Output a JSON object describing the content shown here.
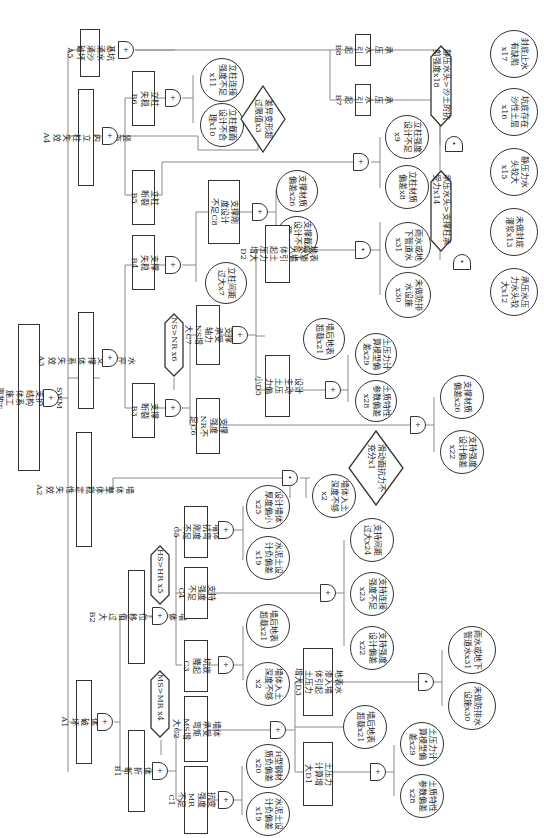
{
  "top_event": {
    "label": "SWM工法支护结构体系施工事故T"
  },
  "level1": [
    {
      "id": "A1",
      "label": "墙体破坏A1"
    },
    {
      "id": "A2",
      "label": "墙体整体稳定性失效A2"
    },
    {
      "id": "A3",
      "label": "水平内支撑体系失效A3"
    },
    {
      "id": "A4",
      "label": "竖直面内立柱失效A4"
    },
    {
      "id": "A5",
      "label": "基坑涌水涌沙破坏A5"
    }
  ],
  "intermediate": {
    "B1": "墙体折断B1",
    "B2": "墙体水平位移值过大B2",
    "B3": "支撑断裂B3",
    "B4": "支撑失稳B4",
    "B5": "立柱断裂B5",
    "B6": "立柱失稳B6",
    "B7": "承压水引起B7",
    "B8": "承压水引起B8",
    "C1": "墙体抗变强度MR不足C1",
    "C2": "墙体承受弯矩MS增大C2",
    "C3": "坑底隆起C3",
    "C4": "支持强度不足C4",
    "C5": "墙体抗弯刚度不足C5",
    "C6": "支撑强度NR不足C6",
    "C7": "支撑承受轴力NS增大C7",
    "C8": "支撑刚度设计不足C8",
    "D1": "土压力计算增大D1",
    "D2": "地表水渗入墙体引起土压力增大D2",
    "D3": "地表水渗入墙体引起土压力增大D3",
    "D5": "设计主动土压力偏小D5"
  },
  "conditions": {
    "x4": "MS>MR x4",
    "x5": "HS>HR x5",
    "x6": "NS>NR x6",
    "x14": "承压水头>支撑柱承受力x14",
    "x18": "静压水头>沙土的抗剪强度x18"
  },
  "undeveloped": {
    "x1": "滑动面抗力不充分x1",
    "x3": "差异变形超过限值x3"
  },
  "basic_events": {
    "x2": "墙体入土深度不够x2",
    "x7": "立柱间距过大x7",
    "x8": "立柱材质偏差x8",
    "x9": "立柱强度设计不足x9",
    "x10": "立柱截面设计不合理x10",
    "x11": "立柱连接强度不足x11",
    "x12": "承压水压力水头较大x12",
    "x13": "未做封底灌浆x13",
    "x15": "静压力水头较大x15",
    "x16": "坑底存在沙性土层x16",
    "x17": "封底止水有缺陷x17",
    "x19": "水泥土设计负偏差x19",
    "x20": "H型钢材质负偏差x20",
    "x21": "墙后地表超载x21",
    "x22": "支持强度设计偏差x22",
    "x23": "支持连接强度不足x23",
    "x24": "支持间距过大x24",
    "x25": "设计墙体厚度偏小x25",
    "x26": "支撑材质偏差x26",
    "x27": "支撑截面设计不合理x27",
    "x28": "土质特性参数偏差x28",
    "x29": "土压力计算模型偏差x29",
    "x30": "未做防排水设施x30",
    "x31": "雨水或地下管道水x31"
  },
  "gate_symbols": {
    "or": "+",
    "and": "•"
  }
}
